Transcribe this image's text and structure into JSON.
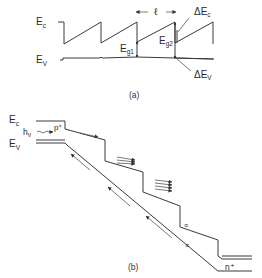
{
  "figure": {
    "panel_a": {
      "caption": "(a)",
      "labels": {
        "ec_main": "E",
        "ec_sub": "c",
        "ev_main": "E",
        "ev_sub": "V",
        "period": "ℓ",
        "eg1_main": "E",
        "eg1_sub": "g1",
        "eg2_main": "E",
        "eg2_sub": "g2",
        "delta_ec_main": "ΔE",
        "delta_ec_sub": "c",
        "delta_ev_main": "ΔE",
        "delta_ev_sub": "V"
      }
    },
    "panel_b": {
      "caption": "(b)",
      "labels": {
        "ec_main": "E",
        "ec_sub": "c",
        "ev_main": "E",
        "ev_sub": "V",
        "photon_main": "h",
        "photon_sub": "ν",
        "p_region": "p⁺",
        "n_region": "n⁺"
      }
    },
    "colors": {
      "line": "#3a3a3a",
      "background": "#ffffff"
    }
  }
}
